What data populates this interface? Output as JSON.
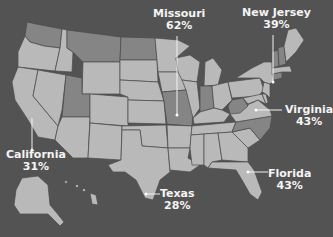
{
  "colors": {
    "background": "#535353",
    "state_default": "#b9b9b9",
    "state_highlighted": "#858585",
    "border": "#4a4a4a",
    "label_text": "#f4f4f4"
  },
  "callouts": [
    {
      "state": "Missouri",
      "value": "62%"
    },
    {
      "state": "New Jersey",
      "value": "39%"
    },
    {
      "state": "Virginia",
      "value": "43%"
    },
    {
      "state": "California",
      "value": "31%"
    },
    {
      "state": "Florida",
      "value": "43%"
    },
    {
      "state": "Texas",
      "value": "28%"
    }
  ],
  "highlighted_states": [
    "Washington",
    "Montana",
    "North Dakota",
    "Utah",
    "Missouri",
    "Indiana",
    "West Virginia",
    "North Carolina",
    "Vermont",
    "New Hampshire",
    "Connecticut"
  ]
}
